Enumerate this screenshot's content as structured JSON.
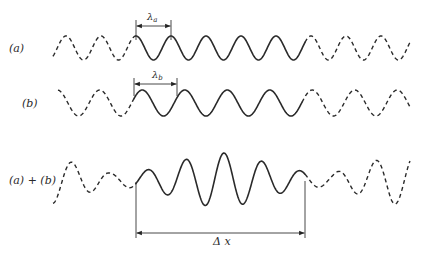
{
  "labels": {
    "a": "(a)",
    "b": "(b)",
    "sum": "(a) + (b)",
    "lambda_a": "λ",
    "lambda_a_sub": "a",
    "lambda_b": "λ",
    "lambda_b_sub": "b",
    "delta_x": "Δ x"
  },
  "waves": {
    "a": {
      "center_y": 48,
      "amplitude": 12,
      "wavelength": 35,
      "phase_x": 136,
      "x_start": 53,
      "solid_start": 136,
      "solid_end": 305,
      "x_end": 410,
      "style": "sinusoid-solid-in-middle-dashed-ends"
    },
    "b": {
      "center_y": 103,
      "amplitude": 13,
      "wavelength": 42.5,
      "phase_x": 134,
      "x_start": 58,
      "solid_start": 134,
      "solid_end": 302,
      "x_end": 410,
      "style": "sinusoid-solid-in-middle-dashed-ends"
    },
    "sum": {
      "center_y": 180,
      "x_start": 53,
      "solid_start": 136,
      "solid_end": 305,
      "x_end": 410,
      "style": "beat-pattern-wave-packet"
    }
  },
  "dimensions": {
    "lambda_a": {
      "x1": 136,
      "x2": 171,
      "y": 26,
      "tick_top": 20,
      "tick_bottom": 40
    },
    "lambda_b": {
      "x1": 134,
      "x2": 177,
      "y": 84,
      "tick_top": 78,
      "tick_bottom": 96
    },
    "delta_x": {
      "x1": 136,
      "x2": 305,
      "y": 233,
      "tick_top": 182,
      "tick_bottom": 238
    }
  }
}
